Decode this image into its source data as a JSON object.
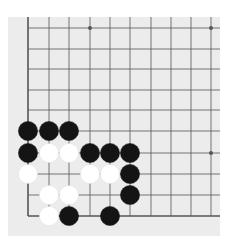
{
  "board": {
    "type": "go-diagram",
    "region": "bottom-left corner",
    "columns": 10,
    "rows": 10,
    "col_x": [
      28,
      49,
      69,
      90,
      110,
      130,
      151,
      171,
      191,
      211
    ],
    "row_y": [
      28,
      49,
      69,
      90,
      110,
      131,
      153,
      174,
      195,
      216
    ],
    "edges": {
      "left": true,
      "bottom": true,
      "top": false,
      "right": false
    },
    "colors": {
      "background": "#ececec",
      "line": "#555555",
      "black": "#141414",
      "white": "#ffffff"
    },
    "star_points": [
      [
        3,
        0
      ],
      [
        9,
        0
      ],
      [
        9,
        6
      ]
    ],
    "stones": [
      {
        "color": "black",
        "col": 0,
        "row": 5
      },
      {
        "color": "black",
        "col": 1,
        "row": 5
      },
      {
        "color": "black",
        "col": 2,
        "row": 5
      },
      {
        "color": "black",
        "col": 0,
        "row": 6
      },
      {
        "color": "white",
        "col": 1,
        "row": 6
      },
      {
        "color": "white",
        "col": 2,
        "row": 6
      },
      {
        "color": "black",
        "col": 3,
        "row": 6
      },
      {
        "color": "black",
        "col": 4,
        "row": 6
      },
      {
        "color": "black",
        "col": 5,
        "row": 6
      },
      {
        "color": "white",
        "col": 0,
        "row": 7
      },
      {
        "color": "white",
        "col": 3,
        "row": 7
      },
      {
        "color": "white",
        "col": 4,
        "row": 7
      },
      {
        "color": "black",
        "col": 5,
        "row": 7
      },
      {
        "color": "white",
        "col": 1,
        "row": 8
      },
      {
        "color": "white",
        "col": 2,
        "row": 8
      },
      {
        "color": "black",
        "col": 5,
        "row": 8
      },
      {
        "color": "white",
        "col": 1,
        "row": 9
      },
      {
        "color": "black",
        "col": 2,
        "row": 9
      },
      {
        "color": "black",
        "col": 4,
        "row": 9
      }
    ]
  }
}
